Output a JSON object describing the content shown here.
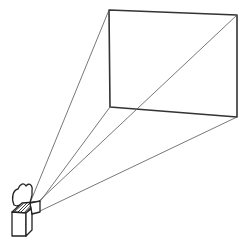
{
  "diagram": {
    "type": "projection-illustration",
    "colors": {
      "stroke": "#333333",
      "background": "#ffffff"
    },
    "screen": {
      "corners": {
        "tl": [
          109,
          10
        ],
        "tr": [
          237,
          15
        ],
        "br": [
          237,
          117
        ],
        "bl": [
          110,
          107
        ]
      }
    },
    "projector": {
      "lens_origin": [
        36,
        206
      ]
    }
  }
}
